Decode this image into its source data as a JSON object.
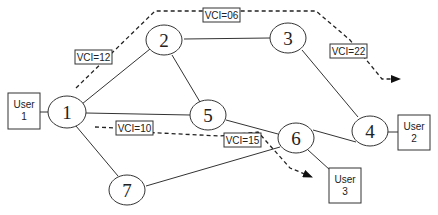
{
  "diagram": {
    "nodes": [
      {
        "id": "1",
        "label": "1"
      },
      {
        "id": "2",
        "label": "2"
      },
      {
        "id": "3",
        "label": "3"
      },
      {
        "id": "4",
        "label": "4"
      },
      {
        "id": "5",
        "label": "5"
      },
      {
        "id": "6",
        "label": "6"
      },
      {
        "id": "7",
        "label": "7"
      }
    ],
    "users": [
      {
        "id": "user1",
        "line1": "User",
        "line2": "1",
        "attached_to": "1"
      },
      {
        "id": "user2",
        "line1": "User",
        "line2": "2",
        "attached_to": "4"
      },
      {
        "id": "user3",
        "line1": "User",
        "line2": "3",
        "attached_to": "6"
      }
    ],
    "links": [
      [
        "1",
        "2"
      ],
      [
        "1",
        "5"
      ],
      [
        "1",
        "7"
      ],
      [
        "2",
        "3"
      ],
      [
        "2",
        "5"
      ],
      [
        "3",
        "4"
      ],
      [
        "5",
        "6"
      ],
      [
        "4",
        "6"
      ],
      [
        "7",
        "6"
      ]
    ],
    "virtual_circuits": [
      {
        "from": "User 1",
        "to": "User 2",
        "via": [
          "1",
          "2",
          "3",
          "4"
        ],
        "labels": [
          "VCI=12",
          "VCI=06",
          "VCI=22"
        ]
      },
      {
        "from": "User 1",
        "to": "User 3",
        "via": [
          "1",
          "5",
          "6"
        ],
        "labels": [
          "VCI=10",
          "VCI=15"
        ]
      }
    ],
    "vci_labels": {
      "vci12": "VCI=12",
      "vci06": "VCI=06",
      "vci22": "VCI=22",
      "vci10": "VCI=10",
      "vci15": "VCI=15"
    }
  }
}
